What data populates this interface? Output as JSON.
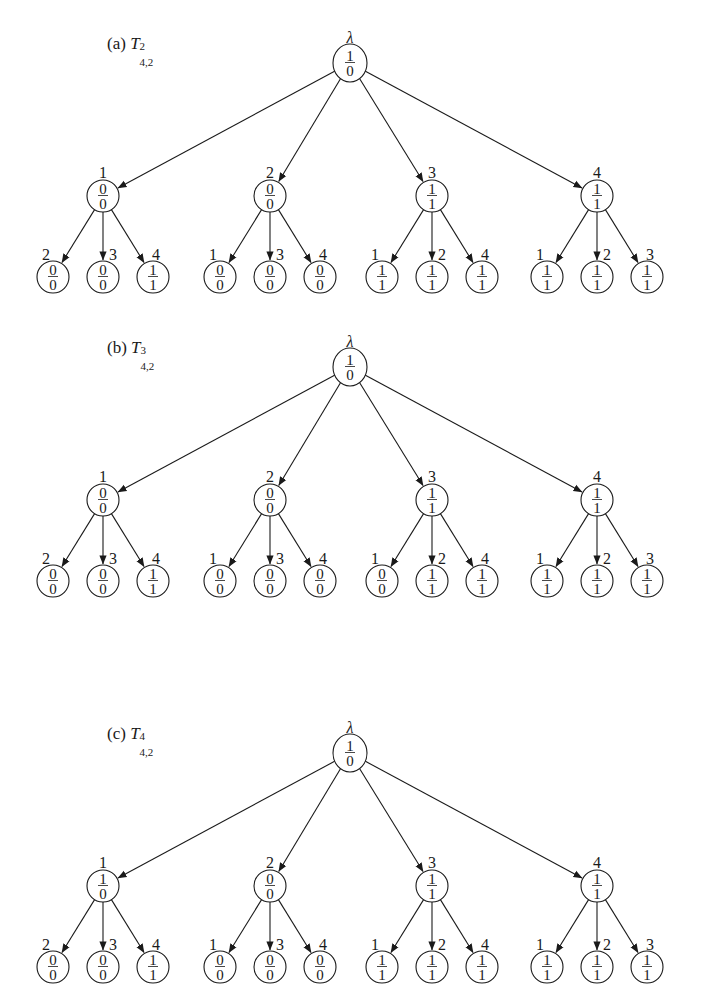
{
  "figure": {
    "trees": [
      {
        "id": "a",
        "caption": {
          "prefix": "(a) ",
          "symbol": "T",
          "superscript": "2",
          "subscript": "4,2"
        },
        "origin_y": 0,
        "root": {
          "label": "λ",
          "top": "1",
          "bottom": "0"
        },
        "children": [
          {
            "label": "1",
            "top": "0",
            "bottom": "0",
            "leaves": [
              {
                "label": "2",
                "top": "0",
                "bottom": "0"
              },
              {
                "label": "3",
                "top": "0",
                "bottom": "0"
              },
              {
                "label": "4",
                "top": "1",
                "bottom": "1"
              }
            ]
          },
          {
            "label": "2",
            "top": "0",
            "bottom": "0",
            "leaves": [
              {
                "label": "1",
                "top": "0",
                "bottom": "0"
              },
              {
                "label": "3",
                "top": "0",
                "bottom": "0"
              },
              {
                "label": "4",
                "top": "0",
                "bottom": "0"
              }
            ]
          },
          {
            "label": "3",
            "top": "1",
            "bottom": "1",
            "leaves": [
              {
                "label": "1",
                "top": "1",
                "bottom": "1"
              },
              {
                "label": "2",
                "top": "1",
                "bottom": "1"
              },
              {
                "label": "4",
                "top": "1",
                "bottom": "1"
              }
            ]
          },
          {
            "label": "4",
            "top": "1",
            "bottom": "1",
            "leaves": [
              {
                "label": "1",
                "top": "1",
                "bottom": "1"
              },
              {
                "label": "2",
                "top": "1",
                "bottom": "1"
              },
              {
                "label": "3",
                "top": "1",
                "bottom": "1"
              }
            ]
          }
        ]
      },
      {
        "id": "b",
        "caption": {
          "prefix": "(b) ",
          "symbol": "T",
          "superscript": "3",
          "subscript": "4,2"
        },
        "origin_y": 304,
        "root": {
          "label": "λ",
          "top": "1",
          "bottom": "0"
        },
        "children": [
          {
            "label": "1",
            "top": "0",
            "bottom": "0",
            "leaves": [
              {
                "label": "2",
                "top": "0",
                "bottom": "0"
              },
              {
                "label": "3",
                "top": "0",
                "bottom": "0"
              },
              {
                "label": "4",
                "top": "1",
                "bottom": "1"
              }
            ]
          },
          {
            "label": "2",
            "top": "0",
            "bottom": "0",
            "leaves": [
              {
                "label": "1",
                "top": "0",
                "bottom": "0"
              },
              {
                "label": "3",
                "top": "0",
                "bottom": "0"
              },
              {
                "label": "4",
                "top": "0",
                "bottom": "0"
              }
            ]
          },
          {
            "label": "3",
            "top": "1",
            "bottom": "1",
            "leaves": [
              {
                "label": "1",
                "top": "0",
                "bottom": "0"
              },
              {
                "label": "2",
                "top": "1",
                "bottom": "1"
              },
              {
                "label": "4",
                "top": "1",
                "bottom": "1"
              }
            ]
          },
          {
            "label": "4",
            "top": "1",
            "bottom": "1",
            "leaves": [
              {
                "label": "1",
                "top": "1",
                "bottom": "1"
              },
              {
                "label": "2",
                "top": "1",
                "bottom": "1"
              },
              {
                "label": "3",
                "top": "1",
                "bottom": "1"
              }
            ]
          }
        ]
      },
      {
        "id": "c",
        "caption": {
          "prefix": "(c) ",
          "symbol": "T",
          "superscript": "4",
          "subscript": "4,2"
        },
        "origin_y": 690,
        "root": {
          "label": "λ",
          "top": "1",
          "bottom": "0"
        },
        "children": [
          {
            "label": "1",
            "top": "1",
            "bottom": "0",
            "leaves": [
              {
                "label": "2",
                "top": "0",
                "bottom": "0"
              },
              {
                "label": "3",
                "top": "0",
                "bottom": "0"
              },
              {
                "label": "4",
                "top": "1",
                "bottom": "1"
              }
            ]
          },
          {
            "label": "2",
            "top": "0",
            "bottom": "0",
            "leaves": [
              {
                "label": "1",
                "top": "0",
                "bottom": "0"
              },
              {
                "label": "3",
                "top": "0",
                "bottom": "0"
              },
              {
                "label": "4",
                "top": "0",
                "bottom": "0"
              }
            ]
          },
          {
            "label": "3",
            "top": "1",
            "bottom": "1",
            "leaves": [
              {
                "label": "1",
                "top": "1",
                "bottom": "1"
              },
              {
                "label": "2",
                "top": "1",
                "bottom": "1"
              },
              {
                "label": "4",
                "top": "1",
                "bottom": "1"
              }
            ]
          },
          {
            "label": "4",
            "top": "1",
            "bottom": "1",
            "leaves": [
              {
                "label": "1",
                "top": "1",
                "bottom": "1"
              },
              {
                "label": "2",
                "top": "1",
                "bottom": "1"
              },
              {
                "label": "3",
                "top": "1",
                "bottom": "1"
              }
            ]
          }
        ]
      }
    ]
  }
}
